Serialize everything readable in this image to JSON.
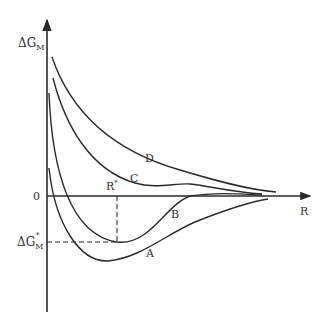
{
  "diagram": {
    "title": "",
    "y_axis": {
      "label_main": "ΔG",
      "label_sub": "M"
    },
    "x_axis": {
      "label": "R"
    },
    "origin_label": "0",
    "marker": {
      "r_star": {
        "main": "R",
        "sup": "*"
      },
      "g_star": {
        "main": "ΔG",
        "sub": "M",
        "sup": "*"
      }
    },
    "curves": [
      {
        "id": "A",
        "label": "A"
      },
      {
        "id": "B",
        "label": "B"
      },
      {
        "id": "C",
        "label": "C"
      },
      {
        "id": "D",
        "label": "D"
      }
    ],
    "colors": {
      "line": "#2a2a2a",
      "text": "#333333",
      "background": "#ffffff"
    }
  }
}
